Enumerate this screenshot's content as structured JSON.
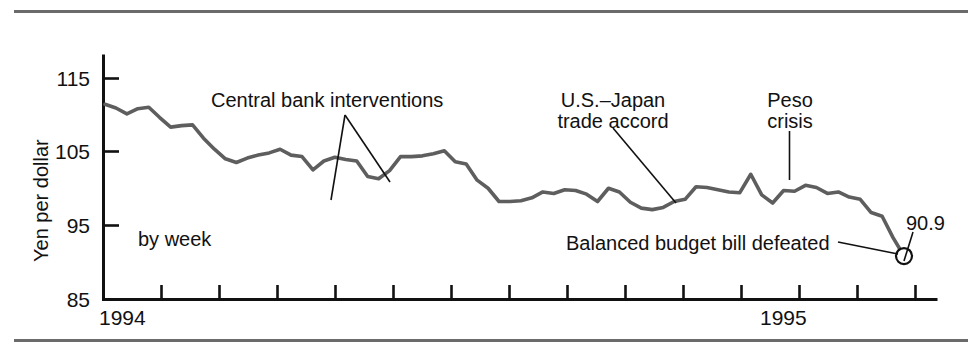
{
  "figure": {
    "axis_title": "Yen per dollar",
    "frequency_note": "by week",
    "end_value_label": "90.9"
  },
  "annotations": [
    {
      "id": "central-bank",
      "text": "Central bank interventions"
    },
    {
      "id": "us-japan",
      "line1": "U.S.–Japan",
      "line2": "trade accord"
    },
    {
      "id": "peso",
      "line1": "Peso",
      "line2": "crisis"
    },
    {
      "id": "balanced-budget",
      "text": "Balanced budget bill defeated"
    }
  ],
  "chart_data": {
    "type": "line",
    "title": "",
    "xlabel": "",
    "ylabel": "Yen per dollar",
    "ylim": [
      85,
      118
    ],
    "yticks": [
      85,
      95,
      105,
      115
    ],
    "ytick_labels": [
      "85",
      "95",
      "105",
      "115"
    ],
    "xtick_labels": [
      "1994",
      "1995"
    ],
    "grid": false,
    "legend": "none",
    "series_name": "Yen per dollar (weekly)",
    "line_color": "#5e5e5e",
    "end_point": {
      "label": "90.9",
      "value": 90.9
    },
    "values": [
      111.5,
      111.0,
      110.2,
      110.9,
      111.1,
      109.7,
      108.4,
      108.6,
      108.7,
      106.9,
      105.4,
      104.1,
      103.6,
      104.2,
      104.6,
      104.9,
      105.4,
      104.6,
      104.4,
      102.6,
      103.8,
      104.3,
      104.0,
      103.8,
      101.7,
      101.4,
      102.5,
      104.4,
      104.4,
      104.5,
      104.8,
      105.2,
      103.7,
      103.4,
      101.2,
      100.1,
      98.3,
      98.3,
      98.4,
      98.8,
      99.6,
      99.4,
      99.9,
      99.8,
      99.3,
      98.3,
      100.1,
      99.6,
      98.2,
      97.4,
      97.2,
      97.5,
      98.3,
      98.6,
      100.3,
      100.2,
      99.9,
      99.6,
      99.5,
      102.0,
      99.2,
      98.1,
      99.8,
      99.7,
      100.5,
      100.2,
      99.4,
      99.6,
      98.9,
      98.6,
      96.8,
      96.3,
      93.4,
      90.9
    ],
    "x_domain": [
      "1994 week 1",
      "1995 week 22"
    ],
    "annotations": [
      {
        "text": "Central bank interventions",
        "points": [
          {
            "x_index": 45
          },
          {
            "x_index": 51
          }
        ]
      },
      {
        "text": "U.S.–Japan trade accord",
        "points": [
          {
            "x_index": 50
          }
        ]
      },
      {
        "text": "Peso crisis",
        "points": [
          {
            "x_index": 59,
            "value": 102.0
          }
        ]
      },
      {
        "text": "Balanced budget bill defeated",
        "points": [
          {
            "x_index": 73,
            "value": 90.9
          }
        ]
      }
    ]
  }
}
